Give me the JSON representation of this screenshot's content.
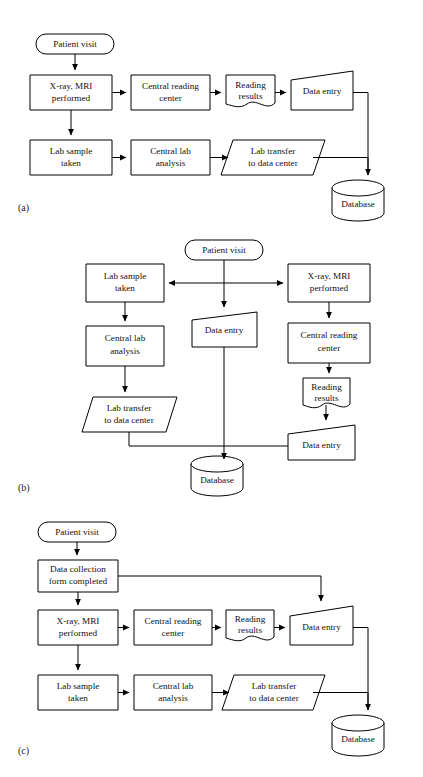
{
  "figure": {
    "panels": [
      {
        "id": "a",
        "caption": "(a)",
        "nodes": {
          "patient_visit": "Patient visit",
          "xray_mri": "X-ray, MRI\nperformed",
          "central_reading": "Central reading\ncenter",
          "reading_results": "Reading\nresults",
          "data_entry": "Data entry",
          "lab_sample": "Lab sample\ntaken",
          "central_lab": "Central lab\nanalysis",
          "lab_transfer": "Lab transfer\nto data center",
          "database": "Database"
        }
      },
      {
        "id": "b",
        "caption": "(b)",
        "nodes": {
          "patient_visit": "Patient visit",
          "lab_sample": "Lab sample\ntaken",
          "xray_mri": "X-ray, MRI\nperformed",
          "data_entry_mid": "Data entry",
          "central_lab": "Central lab\nanalysis",
          "central_reading": "Central reading\ncenter",
          "lab_transfer": "Lab transfer\nto data center",
          "reading_results": "Reading\nresults",
          "data_entry_right": "Data entry",
          "database": "Database"
        }
      },
      {
        "id": "c",
        "caption": "(c)",
        "nodes": {
          "patient_visit": "Patient visit",
          "data_collection_form": "Data collection\nform completed",
          "xray_mri": "X-ray, MRI\nperformed",
          "central_reading": "Central reading\ncenter",
          "reading_results": "Reading\nresults",
          "data_entry": "Data entry",
          "lab_sample": "Lab sample\ntaken",
          "central_lab": "Central lab\nanalysis",
          "lab_transfer": "Lab transfer\nto data center",
          "database": "Database"
        }
      }
    ]
  },
  "colors": {
    "stroke": "#000000",
    "fill": "#ffffff",
    "text": "#111111"
  }
}
